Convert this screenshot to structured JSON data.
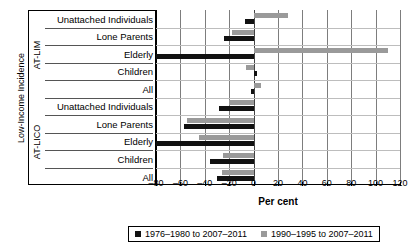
{
  "chart_data": {
    "type": "bar",
    "orientation": "horizontal",
    "title": "",
    "xlabel": "Per cent",
    "ylabel": "Low-Income Incidence",
    "xlim": [
      -80,
      120
    ],
    "xticks": [
      -80,
      -60,
      -40,
      -20,
      0,
      20,
      40,
      60,
      80,
      100,
      120
    ],
    "xtick_labels": [
      "–80",
      "–60",
      "–40",
      "–20",
      "0",
      "20",
      "40",
      "60",
      "80",
      "100",
      "120"
    ],
    "grid": true,
    "legend_position": "bottom",
    "groups": [
      {
        "name": "AT-LIM",
        "categories": [
          "Unattached Individuals",
          "Lone Parents",
          "Elderly",
          "Children",
          "All"
        ]
      },
      {
        "name": "AT-LICO",
        "categories": [
          "Unattached Individuals",
          "Lone Parents",
          "Elderly",
          "Children",
          "All"
        ]
      }
    ],
    "categories": [
      "AT-LIM Unattached Individuals",
      "AT-LIM Lone Parents",
      "AT-LIM Elderly",
      "AT-LIM Children",
      "AT-LIM All",
      "AT-LICO Unattached Individuals",
      "AT-LICO Lone Parents",
      "AT-LICO Elderly",
      "AT-LICO Children",
      "AT-LICO All"
    ],
    "series": [
      {
        "name": "1976–1980 to 2007–2011",
        "color": "#111111",
        "values": [
          -7,
          -24,
          -92,
          3,
          -2,
          -28,
          -57,
          -95,
          -36,
          -30
        ]
      },
      {
        "name": "1990–1995 to 2007–2011",
        "color": "#9a9a9a",
        "values": [
          28,
          -18,
          110,
          -6,
          6,
          -20,
          -55,
          -45,
          -25,
          -26
        ]
      }
    ]
  },
  "axis": {
    "xlabel": "Per cent",
    "ylabel": "Low-Income Incidence"
  },
  "legend": {
    "items": [
      {
        "label": "1976–1980 to 2007–2011",
        "color": "#111111"
      },
      {
        "label": "1990–1995 to 2007–2011",
        "color": "#9a9a9a"
      }
    ]
  },
  "groups": {
    "lim": {
      "name": "AT-LIM"
    },
    "lico": {
      "name": "AT-LICO"
    }
  }
}
